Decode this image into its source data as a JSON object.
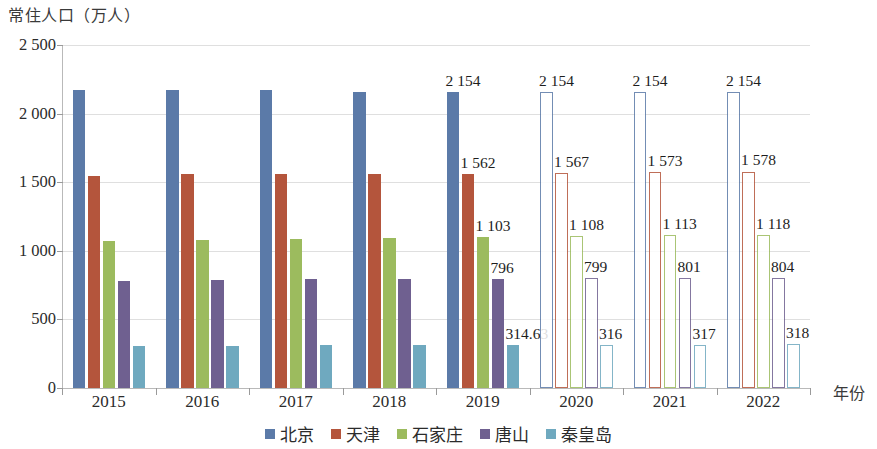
{
  "chart_data": {
    "type": "bar",
    "title": "",
    "ylabel": "常住人口（万人）",
    "xlabel": "年份",
    "categories": [
      "2015",
      "2016",
      "2017",
      "2018",
      "2019",
      "2020",
      "2021",
      "2022"
    ],
    "ylim": [
      0,
      2500
    ],
    "yticks": [
      0,
      500,
      1000,
      1500,
      2000,
      2500
    ],
    "ytick_labels": [
      "0",
      "500",
      "1 000",
      "1 500",
      "2 000",
      "2 500"
    ],
    "grid": true,
    "legend_position": "bottom",
    "series": [
      {
        "name": "北京",
        "color": "#5b7aa8",
        "values": [
          2171,
          2173,
          2171,
          2154,
          2154,
          2154,
          2154,
          2154
        ],
        "labels": [
          "",
          "",
          "",
          "",
          "2 154",
          "2 154",
          "2 154",
          "2 154"
        ]
      },
      {
        "name": "天津",
        "color": "#b4553c",
        "values": [
          1547,
          1562,
          1557,
          1560,
          1562,
          1567,
          1573,
          1578
        ],
        "labels": [
          "",
          "",
          "",
          "",
          "1 562",
          "1 567",
          "1 573",
          "1 578"
        ]
      },
      {
        "name": "石家庄",
        "color": "#9cbb5e",
        "values": [
          1070,
          1078,
          1088,
          1095,
          1103,
          1108,
          1113,
          1118
        ],
        "labels": [
          "",
          "",
          "",
          "",
          "1 103",
          "1 108",
          "1 113",
          "1 118"
        ]
      },
      {
        "name": "唐山",
        "color": "#6f6090",
        "values": [
          781,
          786,
          791,
          796,
          796,
          799,
          801,
          804
        ],
        "labels": [
          "",
          "",
          "",
          "",
          "796",
          "799",
          "801",
          "804"
        ]
      },
      {
        "name": "秦皇岛",
        "color": "#6fa9bf",
        "values": [
          308,
          309,
          311,
          314,
          314.63,
          316,
          317,
          318
        ],
        "labels": [
          "",
          "",
          "",
          "",
          "314.63",
          "316",
          "317",
          "318"
        ]
      }
    ],
    "hollow_categories": [
      "2020",
      "2021",
      "2022"
    ],
    "note": "2015-2019 bars are solid filled (actual data); 2020-2022 bars are hollow outlines (projected data)"
  }
}
